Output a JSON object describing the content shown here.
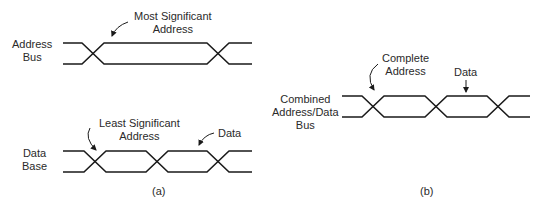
{
  "panel_a": {
    "address_bus": {
      "label_line1": "Address",
      "label_line2": "Bus",
      "annotation_line1": "Most Significant",
      "annotation_line2": "Address"
    },
    "data_bus": {
      "label_line1": "Data",
      "label_line2": "Base",
      "annotation_lsa_line1": "Least Significant",
      "annotation_lsa_line2": "Address",
      "annotation_data": "Data"
    },
    "caption": "(a)"
  },
  "panel_b": {
    "combined_bus": {
      "label_line1": "Combined",
      "label_line2": "Address/Data",
      "label_line3": "Bus",
      "annotation_address_line1": "Complete",
      "annotation_address_line2": "Address",
      "annotation_data": "Data"
    },
    "caption": "(b)"
  },
  "colors": {
    "line": "#1a1a1a",
    "background": "#ffffff"
  }
}
